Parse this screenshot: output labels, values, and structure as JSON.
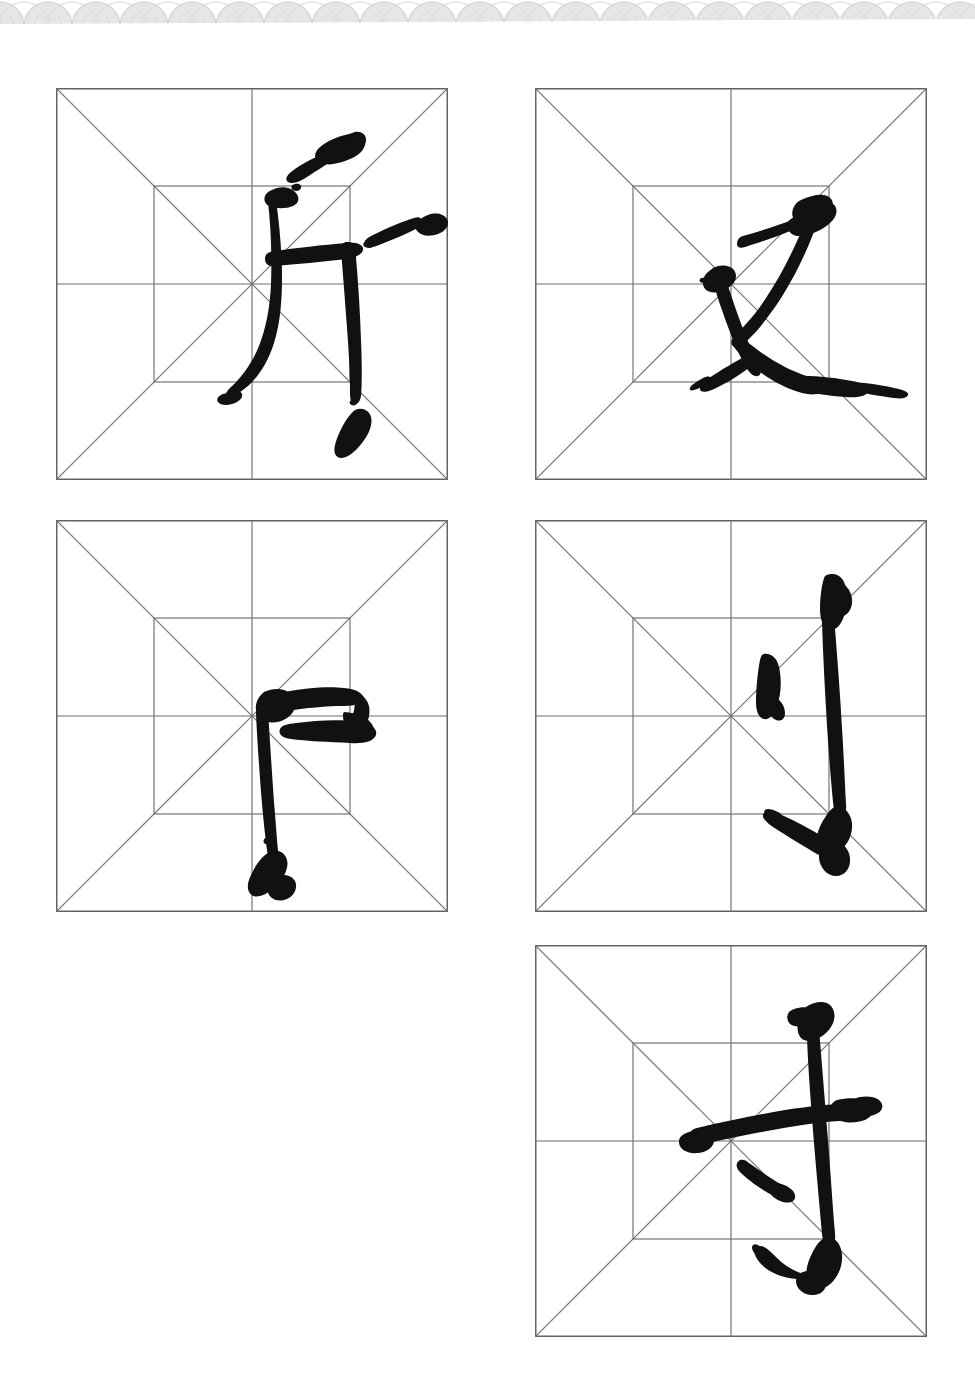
{
  "page": {
    "background_color": "#ffffff",
    "width": 975,
    "height": 1398
  },
  "ornament": {
    "name": "scalloped-arc-border",
    "color": "#e3e3e3",
    "height": 26,
    "description": "Repeating light gray nested-arc / wave pattern across the top edge"
  },
  "grid_style": {
    "name": "mi-zi-ge-nine-palace",
    "line_color": "#6d6d6d",
    "frame_color": "#636363",
    "ink_color": "#111111",
    "inner_square_inset_percent": 25,
    "has_diagonals": true,
    "has_center_cross": true
  },
  "cells": [
    {
      "id": "cell-1",
      "character": "斤",
      "romanization": "jin",
      "row": 1,
      "column": 1,
      "x": 56,
      "y": 88
    },
    {
      "id": "cell-2",
      "character": "又",
      "romanization": "you",
      "row": 1,
      "column": 2,
      "x": 535,
      "y": 88
    },
    {
      "id": "cell-3",
      "character": "卩",
      "romanization": "jie",
      "row": 2,
      "column": 1,
      "x": 56,
      "y": 520
    },
    {
      "id": "cell-4",
      "character": "刂",
      "romanization": "dao",
      "row": 2,
      "column": 2,
      "x": 535,
      "y": 520
    },
    {
      "id": "cell-5",
      "character": "扌",
      "romanization": "shou",
      "row": 3,
      "column": 2,
      "x": 535,
      "y": 945
    }
  ]
}
